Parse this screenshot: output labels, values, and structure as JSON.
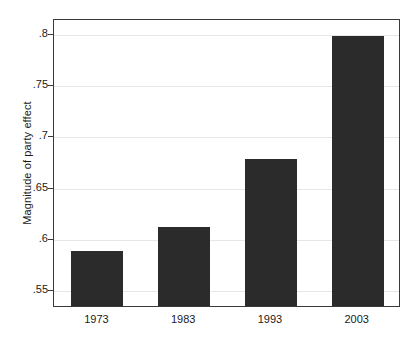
{
  "chart_data": {
    "type": "bar",
    "title": "",
    "subtitle": "",
    "xlabel": "",
    "ylabel": "Magnitude of party effect",
    "categories": [
      "1973",
      "1983",
      "1993",
      "2003"
    ],
    "values": [
      0.589,
      0.612,
      0.679,
      0.799
    ],
    "series": [
      {
        "name": "Magnitude of party effect",
        "values": [
          0.589,
          0.612,
          0.679,
          0.799
        ]
      }
    ],
    "ylim": [
      0.533,
      0.815
    ],
    "yticks": [
      0.55,
      0.6,
      0.65,
      0.7,
      0.75,
      0.8
    ],
    "ytick_labels": [
      ".55",
      ".6",
      ".65",
      ".7",
      ".75",
      ".8"
    ],
    "grid": true,
    "grid_axis": "y",
    "legend": false,
    "legend_position": "none",
    "bar_color": "#2b2b2b",
    "grid_color": "#e6e6e6",
    "axis_color": "#3a3a3a",
    "background_color": "#ffffff"
  }
}
